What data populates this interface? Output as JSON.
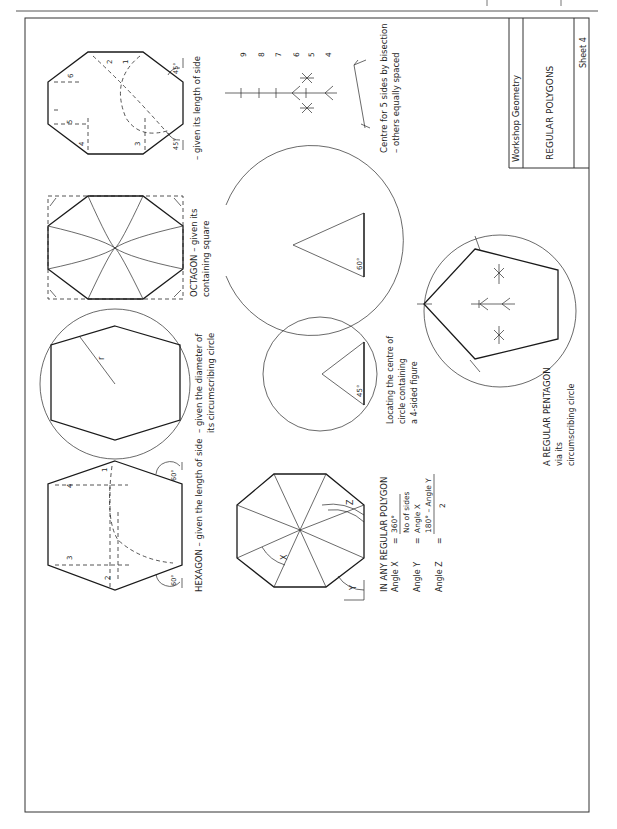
{
  "page": {
    "header_rule": true,
    "orientation": "rotated 90° counter-clockwise (text reads bottom-to-top)"
  },
  "title_block": {
    "subject": "Workshop Geometry",
    "title": "REGULAR POLYGONS",
    "sheet": "Sheet 4"
  },
  "figures": {
    "octagon_side": {
      "caption": "– given its length of side",
      "step_labels": [
        "1",
        "2",
        "3",
        "4",
        "5",
        "6"
      ],
      "angle_labels": [
        "45°",
        "45°"
      ]
    },
    "octagon_square": {
      "caption_line1": "OCTAGON – given its",
      "caption_line2": "containing square"
    },
    "hexagon_circle": {
      "caption_line1": "– given the diameter of",
      "caption_line2": "its circumscribing circle",
      "radius_label": "r"
    },
    "hexagon_side": {
      "caption": "HEXAGON – given the length of side",
      "step_labels": [
        "1",
        "2",
        "3",
        "4"
      ],
      "angle_labels": [
        "60°",
        "60°"
      ]
    },
    "bisection_scale": {
      "caption_line1": "Centre for 5 sides by bisection",
      "caption_line2": "– others equally spaced",
      "numbers": [
        "9",
        "8",
        "7",
        "6",
        "5",
        "4"
      ]
    },
    "circle_60": {
      "angle_label": "60°"
    },
    "circle_45": {
      "angle_label": "45°",
      "caption_line1": "Locating the centre of",
      "caption_line2": "circle containing",
      "caption_line3": "a 4-sided figure"
    },
    "pentagon": {
      "caption_line1": "A REGULAR PENTAGON",
      "caption_line2": "via its",
      "caption_line3": "circumscribing circle"
    },
    "regular_polygon": {
      "heading": "IN ANY REGULAR POLYGON",
      "angle_labels": [
        "X",
        "Y",
        "Z"
      ],
      "formulas": [
        {
          "name": "Angle X",
          "eq": "=",
          "numerator": "360°",
          "denominator": "No of sides"
        },
        {
          "name": "Angle Y",
          "eq": "=",
          "value": "Angle X"
        },
        {
          "name": "Angle Z",
          "eq": "=",
          "numerator": "180° – Angle Y",
          "denominator": "2"
        }
      ]
    }
  }
}
